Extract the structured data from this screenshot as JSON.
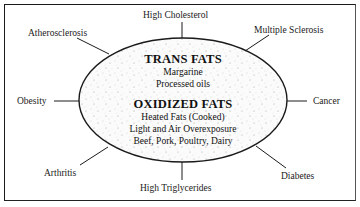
{
  "diagram": {
    "center": {
      "sections": [
        {
          "heading": "TRANS FATS",
          "items": [
            "Margarine",
            "Processed oils"
          ]
        },
        {
          "heading": "OXIDIZED FATS",
          "items": [
            "Heated Fats (Cooked)",
            "Light and Air Overexposure",
            "Beef, Pork, Poultry, Dairy"
          ]
        }
      ]
    },
    "outcomes": {
      "top": "High Cholesterol",
      "top_right": "Multiple Sclerosis",
      "top_left": "Atherosclerosis",
      "left": "Obesity",
      "right": "Cancer",
      "bottom_left": "Arthritis",
      "bottom": "High Triglycerides",
      "bottom_right": "Diabetes"
    },
    "colors": {
      "line": "#1a1a1a",
      "ellipse_fill": "#f4f4f4",
      "text": "#111111"
    }
  }
}
